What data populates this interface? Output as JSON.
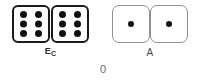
{
  "figure": {
    "bottom_label": "0",
    "background_color": "#ffffff",
    "pip_color": "#111111"
  },
  "tiles": [
    {
      "id": "tile-ec",
      "label": "E",
      "label_subscript": "C",
      "label_full": "E_C",
      "style": "heavy",
      "border_color": "#1a1a1a",
      "halves": [
        {
          "pips": 6
        },
        {
          "pips": 6
        }
      ]
    },
    {
      "id": "tile-a",
      "label": "A",
      "label_subscript": "",
      "label_full": "A",
      "style": "light",
      "border_color": "#8e8e8e",
      "halves": [
        {
          "pips": 1
        },
        {
          "pips": 1
        }
      ]
    }
  ]
}
